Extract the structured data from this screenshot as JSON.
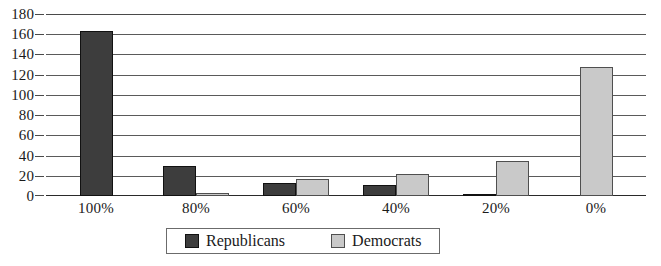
{
  "chart_data": {
    "type": "bar",
    "title": "",
    "subtitle": "",
    "xlabel": "",
    "ylabel": "",
    "categories": [
      "100%",
      "80%",
      "60%",
      "40%",
      "20%",
      "0%"
    ],
    "series": [
      {
        "name": "Republicans",
        "color": "#3d3d3d",
        "values": [
          163,
          30,
          13,
          11,
          1,
          0
        ]
      },
      {
        "name": "Democrats",
        "color": "#c9c9c9",
        "values": [
          0,
          3,
          17,
          22,
          35,
          128
        ]
      }
    ],
    "ylim": [
      0,
      180
    ],
    "ytick_step": 20,
    "yticks": [
      180,
      160,
      140,
      120,
      100,
      80,
      60,
      40,
      20,
      0
    ],
    "grid": true,
    "legend_position": "bottom-center",
    "annotations": []
  },
  "legend": {
    "items": [
      {
        "label": "Republicans",
        "swatch": "dark-gray-swatch"
      },
      {
        "label": "Democrats",
        "swatch": "light-gray-swatch"
      }
    ]
  }
}
